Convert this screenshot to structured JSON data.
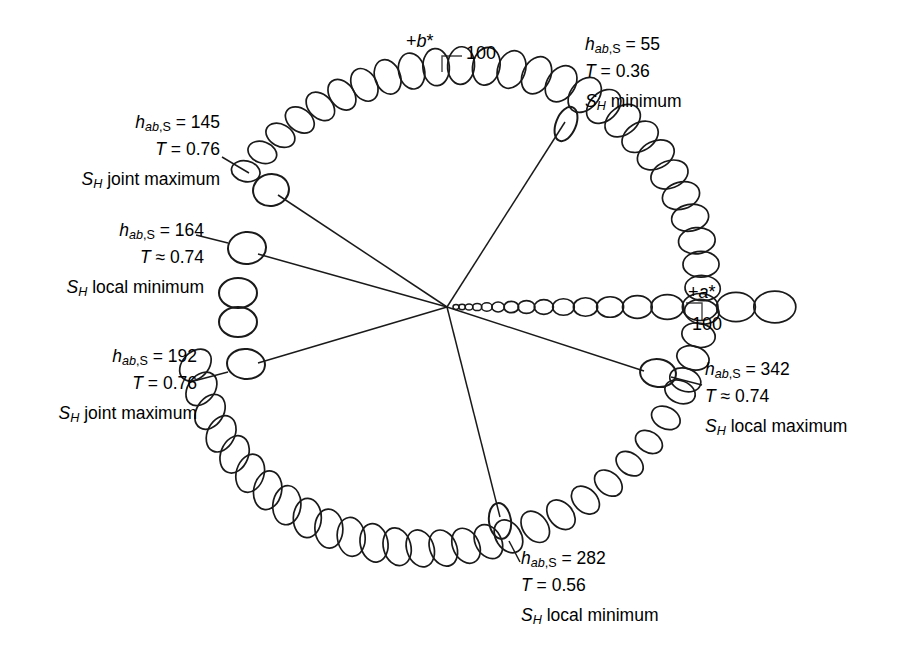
{
  "figure": {
    "stroke_color": "#1a1a1a",
    "background_color": "#ffffff"
  },
  "axes": {
    "b_star": {
      "label": "+b*",
      "tick_value": "100"
    },
    "a_star": {
      "label": "+a*",
      "tick_value": "100"
    }
  },
  "callouts": [
    {
      "id": "hue-145",
      "hue_label": "h",
      "hue_sub": "ab,S",
      "hue_value": "145",
      "hue_line": "hₐb,S = 145",
      "t_symbol": "T",
      "t_relation": "=",
      "t_value": "0.76",
      "t_line": "T = 0.76",
      "s_symbol": "S",
      "s_sub": "H",
      "desc": "joint maximum",
      "s_line": "S_H joint maximum"
    },
    {
      "id": "hue-164",
      "hue_label": "h",
      "hue_sub": "ab,S",
      "hue_value": "164",
      "hue_line": "hₐb,S = 164",
      "t_symbol": "T",
      "t_relation": "≈",
      "t_value": "0.74",
      "t_line": "T ≈ 0.74",
      "s_symbol": "S",
      "s_sub": "H",
      "desc": "local minimum",
      "s_line": "S_H local minimum"
    },
    {
      "id": "hue-192",
      "hue_label": "h",
      "hue_sub": "ab,S",
      "hue_value": "192",
      "hue_line": "hₐb,S = 192",
      "t_symbol": "T",
      "t_relation": "=",
      "t_value": "0.76",
      "t_line": "T = 0.76",
      "s_symbol": "S",
      "s_sub": "H",
      "desc": "joint maximum",
      "s_line": "S_H joint maximum"
    },
    {
      "id": "hue-282",
      "hue_label": "h",
      "hue_sub": "ab,S",
      "hue_value": "282",
      "hue_line": "hₐb,S = 282",
      "t_symbol": "T",
      "t_relation": "=",
      "t_value": "0.56",
      "t_line": "T = 0.56",
      "s_symbol": "S",
      "s_sub": "H",
      "desc": "local minimum",
      "s_line": "S_H local minimum"
    },
    {
      "id": "hue-342",
      "hue_label": "h",
      "hue_sub": "ab,S",
      "hue_value": "342",
      "hue_line": "hₐb,S = 342",
      "t_symbol": "T",
      "t_relation": "≈",
      "t_value": "0.74",
      "t_line": "T ≈ 0.74",
      "s_symbol": "S",
      "s_sub": "H",
      "desc": "local maximum",
      "s_line": "S_H local maximum"
    },
    {
      "id": "hue-55",
      "hue_label": "h",
      "hue_sub": "ab,S",
      "hue_value": "55",
      "hue_line": "hₐb,S = 55",
      "t_symbol": "T",
      "t_relation": "=",
      "t_value": "0.36",
      "t_line": "T = 0.36",
      "s_symbol": "S",
      "s_sub": "H",
      "desc": "minimum",
      "s_line": "S_H minimum"
    }
  ],
  "chart_data": {
    "type": "scatter",
    "xlabel": "+a*",
    "ylabel": "+b*",
    "x_tick_labels": [
      "100"
    ],
    "y_tick_labels": [
      "100"
    ],
    "center": {
      "x": 447,
      "y": 307,
      "a_star": 0,
      "b_star": 0
    },
    "radius_at_100": 248,
    "grid": false,
    "legend": false,
    "annotations": [
      {
        "hue_ab_S": 145,
        "T": 0.76,
        "relation": "=",
        "note": "S_H joint maximum"
      },
      {
        "hue_ab_S": 164,
        "T": 0.74,
        "relation": "≈",
        "note": "S_H local minimum"
      },
      {
        "hue_ab_S": 192,
        "T": 0.76,
        "relation": "=",
        "note": "S_H joint maximum"
      },
      {
        "hue_ab_S": 282,
        "T": 0.56,
        "relation": "=",
        "note": "S_H local minimum"
      },
      {
        "hue_ab_S": 342,
        "T": 0.74,
        "relation": "≈",
        "note": "S_H local maximum"
      },
      {
        "hue_ab_S": 55,
        "T": 0.36,
        "relation": "=",
        "note": "S_H minimum"
      }
    ],
    "outer_arcs": [
      {
        "name": "upper-left-arc",
        "hue_start_deg": 57,
        "hue_end_deg": 146,
        "count": 16
      },
      {
        "name": "right-arc",
        "hue_start_deg": 343,
        "hue_end_deg": 52,
        "count": 14
      },
      {
        "name": "lower-left-arc",
        "hue_start_deg": 193,
        "hue_end_deg": 280,
        "count": 17
      },
      {
        "name": "lower-right-arc",
        "hue_start_deg": 285,
        "hue_end_deg": 340,
        "count": 9
      }
    ],
    "radial_chain": {
      "name": "a-star-axis-chain",
      "hue_deg": 0,
      "count": 17,
      "description": "ellipses growing in size from the achromatic centre out to +a* = 100"
    },
    "marker_points": [
      {
        "hue_ab_S": 145,
        "kind": "isolated-marker"
      },
      {
        "hue_ab_S": 164,
        "kind": "isolated-marker"
      },
      {
        "hue_ab_S": 192,
        "kind": "isolated-marker"
      },
      {
        "hue_ab_S": 282,
        "kind": "isolated-marker"
      },
      {
        "hue_ab_S": 342,
        "kind": "isolated-marker"
      },
      {
        "hue_ab_S": 55,
        "kind": "isolated-marker"
      },
      {
        "hue_ab_S": 177,
        "kind": "paired-marker-upper"
      },
      {
        "hue_ab_S": 183,
        "kind": "paired-marker-lower"
      }
    ]
  }
}
